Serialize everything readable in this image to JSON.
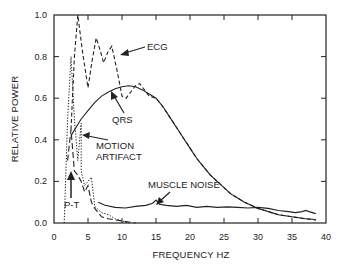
{
  "chart_data": {
    "type": "line",
    "title": "",
    "xlabel": "FREQUENCY HZ",
    "ylabel": "RELATIVE POWER",
    "xlim": [
      0,
      40
    ],
    "ylim": [
      0,
      1.0
    ],
    "grid": false,
    "legend": "none (inline annotations with arrows)",
    "x_ticks": [
      "0",
      "5",
      "10",
      "15",
      "20",
      "25",
      "30",
      "35",
      "40"
    ],
    "y_ticks": [
      "0.0",
      "0.2",
      "0.4",
      "0.6",
      "0.8",
      "1.0"
    ],
    "series": [
      {
        "name": "ECG",
        "style": "dashed",
        "x": [
          2.5,
          3.0,
          3.5,
          4.2,
          5.0,
          5.6,
          6.2,
          6.8,
          7.3,
          7.9,
          8.5,
          9.3,
          10.0,
          10.6,
          11.3,
          12.0,
          12.6,
          13.3,
          14.0,
          15.0,
          16.0,
          17.0,
          18.0,
          19.0,
          20.0,
          21.0,
          22.0,
          23.0,
          24.0,
          25.0,
          26.0,
          27.0,
          28.0,
          29.0,
          30.0,
          31.0,
          32.0,
          33.0,
          34.0,
          35.0,
          36.0,
          37.0,
          38.0,
          38.5
        ],
        "y": [
          0.45,
          0.8,
          1.0,
          0.82,
          0.65,
          0.78,
          0.89,
          0.83,
          0.77,
          0.82,
          0.85,
          0.73,
          0.61,
          0.6,
          0.63,
          0.66,
          0.67,
          0.64,
          0.61,
          0.6,
          0.56,
          0.51,
          0.46,
          0.41,
          0.36,
          0.31,
          0.27,
          0.23,
          0.2,
          0.17,
          0.14,
          0.12,
          0.1,
          0.085,
          0.07,
          0.06,
          0.05,
          0.04,
          0.035,
          0.03,
          0.025,
          0.02,
          0.018,
          0.015
        ]
      },
      {
        "name": "QRS",
        "style": "solid",
        "x": [
          2.5,
          4.0,
          5.0,
          6.0,
          7.0,
          8.0,
          9.0,
          10.0,
          11.0,
          12.0,
          13.0,
          14.0,
          15.0,
          16.0,
          17.0,
          18.0,
          19.0,
          20.0,
          21.0,
          22.0,
          23.0,
          24.0,
          25.0,
          26.0,
          27.0,
          28.0,
          29.0,
          30.0,
          31.0,
          32.0,
          33.0,
          34.0,
          35.0,
          36.0,
          37.0,
          38.0,
          38.5
        ],
        "y": [
          0.42,
          0.5,
          0.54,
          0.58,
          0.61,
          0.63,
          0.645,
          0.655,
          0.66,
          0.655,
          0.64,
          0.62,
          0.6,
          0.56,
          0.51,
          0.46,
          0.41,
          0.36,
          0.31,
          0.27,
          0.23,
          0.2,
          0.17,
          0.14,
          0.12,
          0.1,
          0.085,
          0.07,
          0.06,
          0.05,
          0.04,
          0.035,
          0.03,
          0.025,
          0.02,
          0.018,
          0.015
        ]
      },
      {
        "name": "MOTION ARTIFACT",
        "style": "dotted",
        "x": [
          1.5,
          2.0,
          2.5,
          3.0,
          3.5,
          4.0,
          4.0,
          4.5,
          5.0,
          5.5,
          6.0,
          7.0,
          8.0,
          9.0,
          10.0,
          11.0
        ],
        "y": [
          0.0,
          0.5,
          0.8,
          0.5,
          0.3,
          0.48,
          0.25,
          0.18,
          0.2,
          0.22,
          0.08,
          0.05,
          0.04,
          0.02,
          0.01,
          0.0
        ]
      },
      {
        "name": "P-T",
        "style": "long-dash",
        "x": [
          2.0,
          2.5,
          3.0,
          3.5,
          4.0,
          4.5,
          5.0,
          5.5,
          6.0,
          6.5,
          7.0,
          8.0,
          9.0,
          10.0,
          11.0,
          12.0
        ],
        "y": [
          0.3,
          0.45,
          0.25,
          0.23,
          0.2,
          0.15,
          0.18,
          0.1,
          0.07,
          0.05,
          0.03,
          0.02,
          0.015,
          0.01,
          0.005,
          0.0
        ]
      },
      {
        "name": "MUSCLE NOISE",
        "style": "solid",
        "x": [
          6.5,
          7.5,
          9.0,
          10.5,
          12.0,
          13.5,
          14.5,
          15.0,
          15.5,
          16.5,
          18.0,
          19.5,
          21.0,
          22.5,
          24.0,
          25.5,
          27.0,
          28.5,
          30.0,
          31.5,
          33.0,
          34.5,
          35.5,
          36.5,
          37.0,
          37.5,
          38.5
        ],
        "y": [
          0.1,
          0.085,
          0.075,
          0.072,
          0.08,
          0.085,
          0.095,
          0.11,
          0.09,
          0.085,
          0.08,
          0.085,
          0.075,
          0.08,
          0.075,
          0.078,
          0.075,
          0.072,
          0.075,
          0.07,
          0.06,
          0.055,
          0.05,
          0.055,
          0.06,
          0.055,
          0.045
        ]
      }
    ],
    "annotations": [
      {
        "text": "ECG",
        "x": 15.5,
        "y": 0.86
      },
      {
        "text": "QRS",
        "x": 11.5,
        "y": 0.5
      },
      {
        "text": "MOTION",
        "x": 8.0,
        "y": 0.38
      },
      {
        "text": "ARTIFACT",
        "x": 8.0,
        "y": 0.33
      },
      {
        "text": "MUSCLE NOISE",
        "x": 17.5,
        "y": 0.18
      },
      {
        "text": "P-T",
        "x": 1.8,
        "y": 0.08
      }
    ]
  },
  "labels": {
    "ylabel": "RELATIVE POWER",
    "xlabel": "FREQUENCY HZ",
    "ecg": "ECG",
    "qrs": "QRS",
    "motion_1": "MOTION",
    "motion_2": "ARTIFACT",
    "muscle": "MUSCLE NOISE",
    "pt": "P-T"
  },
  "ticks": {
    "x": [
      "0",
      "5",
      "10",
      "15",
      "20",
      "25",
      "30",
      "35",
      "40"
    ],
    "y": [
      "0.0",
      "0.2",
      "0.4",
      "0.6",
      "0.8",
      "1.0"
    ]
  }
}
